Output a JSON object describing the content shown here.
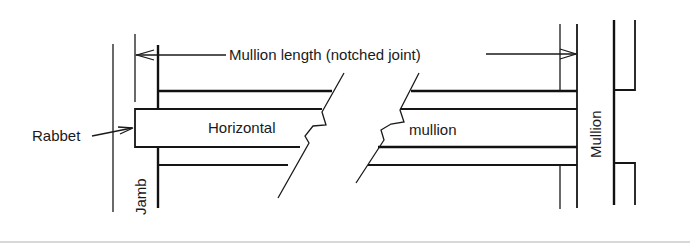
{
  "figure": {
    "type": "technical-drawing",
    "labels": {
      "dimension": "Mullion length (notched joint)",
      "rabbet": "Rabbet",
      "horizontal": "Horizontal",
      "mullion_word": "mullion",
      "jamb": "Jamb",
      "mullion_vertical": "Mullion"
    },
    "colors": {
      "line": "#1a1a1a",
      "background": "#ffffff"
    }
  }
}
